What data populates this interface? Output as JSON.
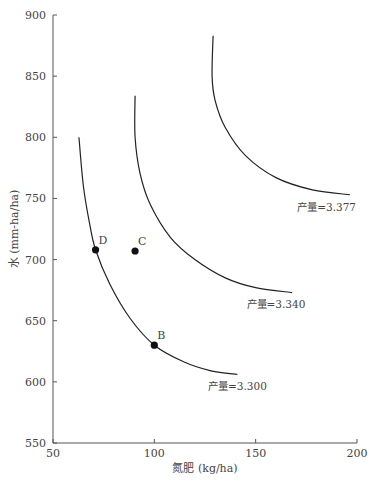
{
  "chart_data": {
    "type": "line",
    "title": "",
    "xlabel": "氮肥 (kg/ha)",
    "ylabel": "水 (mm-ha/ha)",
    "xlim": [
      50,
      200
    ],
    "ylim": [
      550,
      900
    ],
    "x_ticks": [
      50,
      100,
      150,
      200
    ],
    "y_ticks": [
      550,
      600,
      650,
      700,
      750,
      800,
      850,
      900
    ],
    "grid": false,
    "legend": "none",
    "series": [
      {
        "name": "产量=3.300",
        "label": "产量=3.300",
        "points": [
          [
            62.8,
            800
          ],
          [
            65,
            760
          ],
          [
            68,
            730
          ],
          [
            71,
            708
          ],
          [
            78,
            680
          ],
          [
            88,
            652
          ],
          [
            100,
            630
          ],
          [
            115,
            616
          ],
          [
            128,
            609
          ],
          [
            141,
            606
          ]
        ]
      },
      {
        "name": "产量=3.340",
        "label": "产量=3.340",
        "points": [
          [
            90.5,
            834
          ],
          [
            90.5,
            800
          ],
          [
            93,
            770
          ],
          [
            98,
            745
          ],
          [
            108,
            718
          ],
          [
            120,
            700
          ],
          [
            135,
            685
          ],
          [
            150,
            677
          ],
          [
            168,
            673
          ]
        ]
      },
      {
        "name": "产量=3.377",
        "label": "产量=3.377",
        "points": [
          [
            129,
            883
          ],
          [
            128.5,
            850
          ],
          [
            130,
            830
          ],
          [
            135,
            808
          ],
          [
            145,
            785
          ],
          [
            160,
            767
          ],
          [
            178,
            757
          ],
          [
            196.5,
            753
          ]
        ]
      }
    ],
    "annotations": [
      {
        "label": "D",
        "x": 71,
        "y": 708
      },
      {
        "label": "C",
        "x": 90.5,
        "y": 707
      },
      {
        "label": "B",
        "x": 100,
        "y": 630
      }
    ],
    "curve_labels": [
      {
        "text": "产量=3.300",
        "x": 141,
        "y": 593
      },
      {
        "text": "产量=3.340",
        "x": 160,
        "y": 660
      },
      {
        "text": "产量=3.377",
        "x": 185,
        "y": 740
      }
    ]
  }
}
